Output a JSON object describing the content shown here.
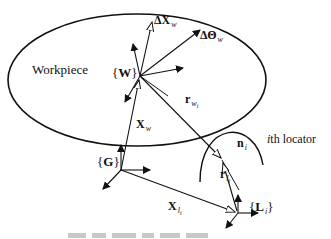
{
  "diagram": {
    "type": "fixture-locator kinematics diagram",
    "workpiece_label": "Workpiece",
    "frames": {
      "workpiece": {
        "brace_open": "{",
        "symbol": "W",
        "brace_close": "}"
      },
      "global": {
        "brace_open": "{",
        "symbol": "G",
        "brace_close": "}"
      },
      "locator": {
        "brace_open": "{",
        "symbol": "L",
        "subscript": "i",
        "brace_close": "}"
      }
    },
    "vectors": {
      "delta_x": {
        "symbol": "ΔX",
        "subscript": "w"
      },
      "delta_theta": {
        "symbol": "ΔΘ",
        "subscript": "w"
      },
      "x_w": {
        "symbol": "X",
        "subscript": "w"
      },
      "r_wi": {
        "symbol": "r",
        "subscript": "w",
        "subsubscript": "i"
      },
      "n_i": {
        "symbol": "n",
        "subscript": "i"
      },
      "r_li": {
        "symbol": "r",
        "subscript": "l",
        "subsubscript": "i"
      },
      "x_li": {
        "symbol": "X",
        "subscript": "l",
        "subsubscript": "i"
      }
    },
    "locator_label": {
      "index": "i",
      "text": "th locator"
    },
    "colors": {
      "stroke": "#111111",
      "background": "#ffffff",
      "caption": "#c8c8c8"
    }
  }
}
